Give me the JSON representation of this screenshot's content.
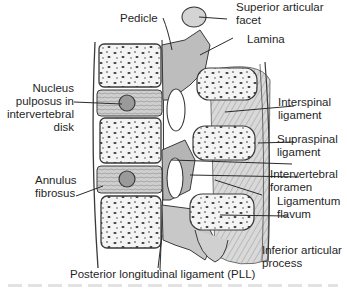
{
  "figure": {
    "colors": {
      "outline": "#3a3a3a",
      "bone_fill": "#f4f4f4",
      "cancellous_spots": "#4a4a4a",
      "ligament_shade": "#9a9a9a",
      "disk_fill": "#bdbdbd",
      "background": "#ffffff"
    }
  },
  "labels": {
    "pedicle": {
      "lines": [
        "Pedicle"
      ]
    },
    "superior_articular_facet": {
      "lines": [
        "Superior articular",
        "facet"
      ]
    },
    "lamina": {
      "lines": [
        "Lamina"
      ]
    },
    "nucleus_pulposus": {
      "lines": [
        "Nucleus",
        "pulposus in",
        "intervertebral",
        "disk"
      ]
    },
    "interspinal_ligament": {
      "lines": [
        "Interspinal",
        "ligament"
      ]
    },
    "supraspinal_ligament": {
      "lines": [
        "Supraspinal",
        "ligament"
      ]
    },
    "annulus_fibrosus": {
      "lines": [
        "Annulus",
        "fibrosus"
      ]
    },
    "intervertebral_foramen": {
      "lines": [
        "Intervertebral",
        "foramen"
      ]
    },
    "ligamentum_flavum": {
      "lines": [
        "Ligamentum",
        "flavum"
      ]
    },
    "inferior_articular_process": {
      "lines": [
        "Inferior articular",
        "process"
      ]
    },
    "pll": {
      "lines": [
        "Posterior longitudinal ligament (PLL)"
      ]
    }
  }
}
